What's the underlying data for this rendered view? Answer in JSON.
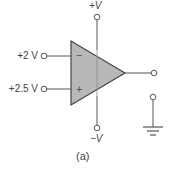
{
  "diagram": {
    "type": "op-amp comparator circuit",
    "caption": "(a)",
    "supply": {
      "positive_label": "+V",
      "negative_label": "−V"
    },
    "inputs": {
      "inverting": {
        "label": "+2 V",
        "sign": "−"
      },
      "non_inverting": {
        "label": "+2.5 V",
        "sign": "+"
      }
    },
    "output": {
      "terminal": "output-terminal"
    },
    "ground": {
      "terminal": "ground-terminal"
    },
    "colors": {
      "triangle_fill": "#b8b8b8",
      "wire": "#555555",
      "text": "#444444",
      "background": "#ffffff"
    }
  }
}
